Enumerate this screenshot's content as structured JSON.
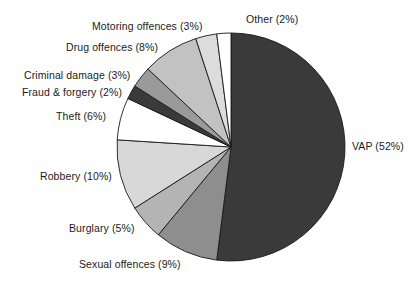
{
  "chart_data": {
    "type": "pie",
    "title": "",
    "subtitle": "",
    "xlabel": "",
    "ylabel": "",
    "grid": false,
    "legend_position": "none",
    "label_format": "{name} ({value}%)",
    "units": "percent",
    "start_angle_deg": 0,
    "direction": "clockwise",
    "center": {
      "x": 231,
      "y": 147
    },
    "radius": 114,
    "categories": [
      "VAP",
      "Sexual offences",
      "Burglary",
      "Robbery",
      "Theft",
      "Fraud & forgery",
      "Criminal damage",
      "Drug offences",
      "Motoring offences",
      "Other"
    ],
    "values": [
      52,
      9,
      5,
      10,
      6,
      2,
      3,
      8,
      3,
      2
    ],
    "colors": [
      "#3a3a3a",
      "#8e8e8e",
      "#b4b4b4",
      "#d8d8d8",
      "#ffffff",
      "#3a3a3a",
      "#9a9a9a",
      "#c2c2c2",
      "#dcdcdc",
      "#ffffff"
    ],
    "slices": [
      {
        "name": "VAP",
        "value": 52,
        "label": "VAP (52%)",
        "color": "#3a3a3a"
      },
      {
        "name": "Sexual offences",
        "value": 9,
        "label": "Sexual offences (9%)",
        "color": "#8e8e8e"
      },
      {
        "name": "Burglary",
        "value": 5,
        "label": "Burglary (5%)",
        "color": "#b4b4b4"
      },
      {
        "name": "Robbery",
        "value": 10,
        "label": "Robbery (10%)",
        "color": "#d8d8d8"
      },
      {
        "name": "Theft",
        "value": 6,
        "label": "Theft (6%)",
        "color": "#ffffff"
      },
      {
        "name": "Fraud & forgery",
        "value": 2,
        "label": "Fraud & forgery (2%)",
        "color": "#3a3a3a"
      },
      {
        "name": "Criminal damage",
        "value": 3,
        "label": "Criminal damage (3%)",
        "color": "#9a9a9a"
      },
      {
        "name": "Drug offences",
        "value": 8,
        "label": "Drug offences (8%)",
        "color": "#c2c2c2"
      },
      {
        "name": "Motoring offences",
        "value": 3,
        "label": "Motoring offences (3%)",
        "color": "#dcdcdc"
      },
      {
        "name": "Other",
        "value": 2,
        "label": "Other (2%)",
        "color": "#ffffff"
      }
    ],
    "total": 100
  },
  "labels": {
    "vap": "VAP (52%)",
    "sexual": "Sexual offences (9%)",
    "burglary": "Burglary (5%)",
    "robbery": "Robbery (10%)",
    "theft": "Theft (6%)",
    "fraud": "Fraud & forgery (2%)",
    "criminal": "Criminal damage (3%)",
    "drug": "Drug offences (8%)",
    "motoring": "Motoring offences (3%)",
    "other": "Other (2%)"
  },
  "style": {
    "background": "#ffffff",
    "text_color": "#1b1b1b",
    "slice_outline": "#1a1a1a"
  }
}
